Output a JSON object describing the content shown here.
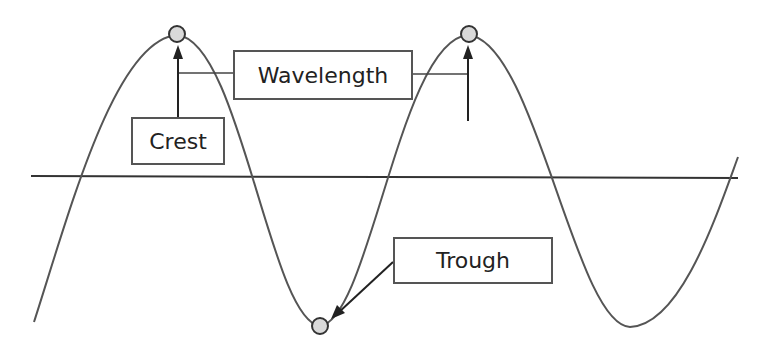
{
  "diagram": {
    "title": "",
    "labels": {
      "crest": "Crest",
      "wavelength": "Wavelength",
      "trough": "Trough"
    },
    "colors": {
      "wave": "#555555",
      "baseline": "#333333",
      "marker_fill": "#d9d9d9",
      "marker_stroke": "#333333",
      "box_border": "#555555",
      "text": "#222222"
    },
    "points": {
      "crest_1": [
        177,
        35
      ],
      "crest_2": [
        468,
        35
      ],
      "trough_1": [
        320,
        326
      ],
      "trough_2": [
        630,
        327
      ]
    },
    "baseline_y": 177
  }
}
